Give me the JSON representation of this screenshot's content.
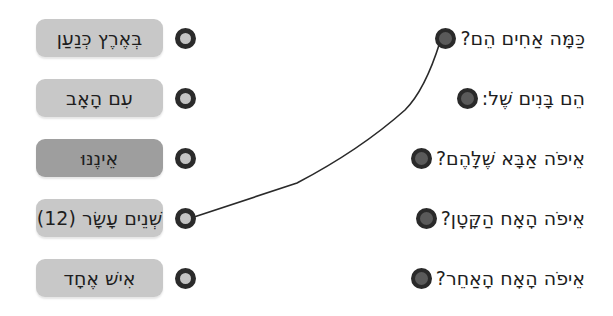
{
  "exercise": {
    "type": "matching",
    "colors": {
      "box_default": "#c8c8c8",
      "box_selected": "#9e9e9e",
      "dot_ring": "#2b2b2b",
      "dot_fill_left": "#c4c4c4",
      "dot_fill_right": "#5a5a5a",
      "line": "#2a2a2a"
    }
  },
  "answers": [
    {
      "label": "בְּאֶרֶץ כְּנַעַן",
      "selected": false
    },
    {
      "label": "עִם הָאָב",
      "selected": false
    },
    {
      "label": "אֵינֶנּוּ",
      "selected": true
    },
    {
      "label": "שְׁנֵים עָשָׂר (12)",
      "selected": false
    },
    {
      "label": "אִישׁ אֶחָד",
      "selected": false
    }
  ],
  "questions": [
    {
      "label": "כַּמָּה אַחִים הֵם?"
    },
    {
      "label": "הֵם בָּנִים שֶׁל:"
    },
    {
      "label": "אֵיפֹה אַבָּא שֶׁלָּהֶם?"
    },
    {
      "label": "אֵיפֹה הָאָח הַקָּטָן?"
    },
    {
      "label": "אֵיפֹה הָאָח הָאַחֵר?"
    }
  ],
  "connections": [
    {
      "question_index": 0,
      "answer_index": 3
    }
  ]
}
